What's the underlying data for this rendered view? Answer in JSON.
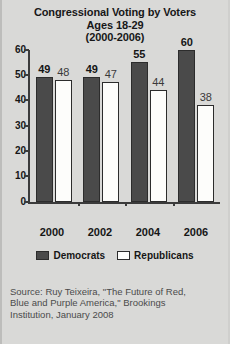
{
  "chart_data": {
    "type": "bar",
    "title": "Congressional Voting by Voters Ages 18-29 (2000-2006)",
    "title_lines": [
      "Congressional Voting by Voters",
      "Ages 18-29",
      "(2000-2006)"
    ],
    "categories": [
      "2000",
      "2002",
      "2004",
      "2006"
    ],
    "series": [
      {
        "name": "Democrats",
        "values": [
          49,
          49,
          55,
          60
        ],
        "color": "#4a4a4a"
      },
      {
        "name": "Republicans",
        "values": [
          48,
          47,
          44,
          38
        ],
        "color": "#fdfdfb"
      }
    ],
    "xlabel": "",
    "ylabel": "",
    "ylim": [
      0,
      60
    ],
    "yticks": [
      0,
      10,
      20,
      30,
      40,
      50,
      60
    ],
    "grid": false,
    "legend_position": "bottom"
  },
  "source": {
    "lines": [
      "Source: Ruy Teixeira, \"The Future of Red,",
      "Blue and Purple America,\" Brookings",
      "Institution, January 2008"
    ]
  },
  "colors": {
    "background": "#d9d9d7",
    "axis": "#3b3b3b",
    "text": "#161616",
    "source_text": "#4b4b4b"
  }
}
